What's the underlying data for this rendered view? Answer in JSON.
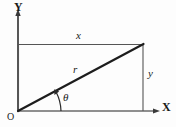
{
  "figure": {
    "kind": "geometry-diagram",
    "width": 176,
    "height": 127,
    "background_color": "#fdfdfd",
    "stroke_color": "#2b2b2b",
    "thin_stroke_color": "#555555",
    "axes": {
      "y_axis_label": "Y",
      "x_axis_label": "X",
      "origin_label": "O"
    },
    "labels": {
      "horizontal_side": "x",
      "vertical_side": "y",
      "hypotenuse": "r",
      "angle": "θ"
    },
    "geometry": {
      "origin": [
        18,
        111
      ],
      "corner": [
        143,
        44
      ],
      "y_axis_top": [
        18,
        12
      ],
      "x_axis_right": [
        160,
        111
      ],
      "angle_arc_degrees": 28
    }
  }
}
